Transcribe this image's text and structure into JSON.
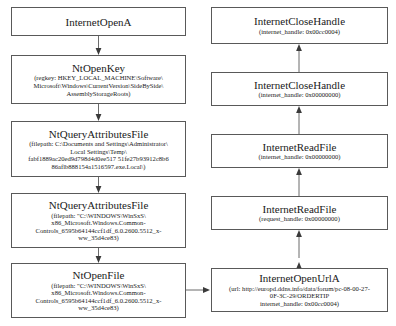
{
  "diagram": {
    "type": "api-call-flow",
    "left_column": [
      {
        "id": "internet-open-a",
        "title": "InternetOpenA",
        "params": []
      },
      {
        "id": "nt-open-key",
        "title": "NtOpenKey",
        "params": [
          "(regkey: HKEY_LOCAL_MACHINE\\Software\\",
          "Microsoft\\Windows\\CurrentVersion\\SideBySide\\",
          "AssemblyStorageRoots)"
        ]
      },
      {
        "id": "nt-query-attributes-file-temp",
        "title": "NtQueryAttributesFile",
        "params": [
          "(filepath: C:\\Documents and Settings\\Administrator\\",
          "Local Settings\\Temp\\",
          "fabf1889ac20ed9d798d4d0ee517 51fe27b93912c8b6",
          "86aflb888154a1516597.exe.Local\\)"
        ]
      },
      {
        "id": "nt-query-attributes-file-winsxs",
        "title": "NtQueryAttributesFile",
        "params": [
          "(filepath: \"C:\\WINDOWS\\WinSxS\\",
          "x86_Microsoft.Windows.Common-",
          "Controls_6595b64144ccf1df_6.0.2600.5512_x-",
          "ww_35d4ce83)"
        ]
      },
      {
        "id": "nt-open-file",
        "title": "NtOpenFile",
        "params": [
          "(filepath: \"C:\\WINDOWS\\WinSxS\\",
          "x86_Microsoft.Windows.Common-",
          "Controls_6595b64144ccf1df_6.0.2600.5512_x-",
          "ww_35d4ce83)"
        ]
      }
    ],
    "right_column": [
      {
        "id": "internet-close-handle-cc",
        "title": "InternetCloseHandle",
        "params": [
          "(internet_handle: 0x00cc0004)"
        ]
      },
      {
        "id": "internet-close-handle-zero",
        "title": "InternetCloseHandle",
        "params": [
          "(internet_handle: 0x00000000)"
        ]
      },
      {
        "id": "internet-read-file-internet",
        "title": "InternetReadFile",
        "params": [
          "(internet_handle: 0x00000000)"
        ]
      },
      {
        "id": "internet-read-file-request",
        "title": "InternetReadFile",
        "params": [
          "(request_handle: 0x00000000)"
        ]
      },
      {
        "id": "internet-open-url-a",
        "title": "InternetOpenUrlA",
        "params": [
          "(url: http://europd.ddns.info/data/forum/pc-08-00-27-",
          "0F-3C-29/ORDERTIP",
          "internet_handle: 0x00cc0004)"
        ]
      }
    ],
    "colors": {
      "box_border": "#595959",
      "edge": "#6b6b6b",
      "background": "#ffffff",
      "text": "#1a1a1a"
    }
  }
}
